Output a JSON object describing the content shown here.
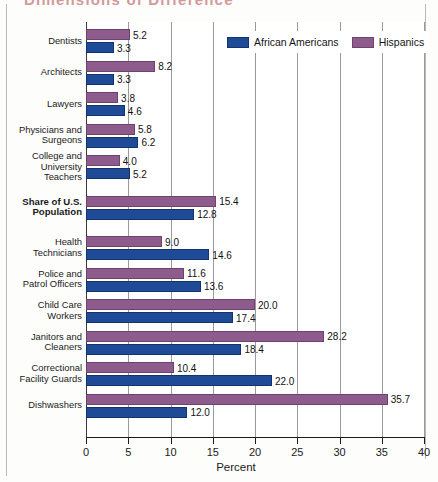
{
  "title": "Dimensions of Difference",
  "legend": {
    "items": [
      {
        "label": "African Americans",
        "color": "#1f4b96",
        "key": "afam"
      },
      {
        "label": "Hispanics",
        "color": "#8d5c8c",
        "key": "hisp"
      }
    ]
  },
  "axis": {
    "x_title": "Percent",
    "ticks": [
      "0",
      "5",
      "10",
      "15",
      "20",
      "25",
      "30",
      "35",
      "40"
    ]
  },
  "chart_data": {
    "type": "bar",
    "orientation": "horizontal",
    "title": "Dimensions of Difference",
    "xlabel": "Percent",
    "ylabel": "",
    "xlim": [
      0,
      40
    ],
    "xticks": [
      0,
      5,
      10,
      15,
      20,
      25,
      30,
      35,
      40
    ],
    "grid": true,
    "legend_position": "top-right-inside",
    "value_label_format": "one decimal",
    "categories": [
      "Dentists",
      "Architects",
      "Lawyers",
      "Physicians and Surgeons",
      "College and University Teachers",
      "Share of U.S. Population",
      "Health Technicians",
      "Police and Patrol Officers",
      "Child Care Workers",
      "Janitors and Cleaners",
      "Correctional Facility Guards",
      "Dishwashers"
    ],
    "category_lines": [
      [
        "Dentists"
      ],
      [
        "Architects"
      ],
      [
        "Lawyers"
      ],
      [
        "Physicians and",
        "Surgeons"
      ],
      [
        "College and",
        "University",
        "Teachers"
      ],
      [
        "Share of U.S.",
        "Population"
      ],
      [
        "Health",
        "Technicians"
      ],
      [
        "Police and",
        "Patrol Officers"
      ],
      [
        "Child Care",
        "Workers"
      ],
      [
        "Janitors and",
        "Cleaners"
      ],
      [
        "Correctional",
        "Facility Guards"
      ],
      [
        "Dishwashers"
      ]
    ],
    "emphasized_category": "Share of U.S. Population",
    "series": [
      {
        "name": "Hispanics",
        "color": "#8d5c8c",
        "values": [
          5.2,
          8.2,
          3.8,
          5.8,
          4.0,
          15.4,
          9.0,
          11.6,
          20.0,
          28.2,
          10.4,
          35.7
        ]
      },
      {
        "name": "African Americans",
        "color": "#1f4b96",
        "values": [
          3.3,
          3.3,
          4.6,
          6.2,
          5.2,
          12.8,
          14.6,
          13.6,
          17.4,
          18.4,
          22.0,
          12.0
        ]
      }
    ]
  }
}
